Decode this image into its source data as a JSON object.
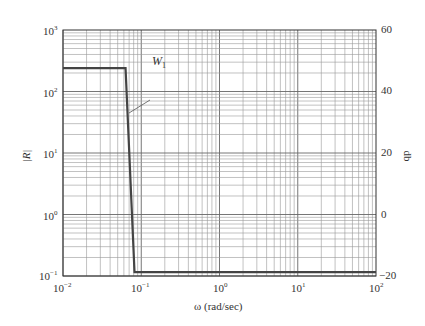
{
  "chart_data": {
    "type": "line",
    "title": "",
    "xlabel": "ω (rad/sec)",
    "ylabel": "|R|",
    "ylabel_right": "db",
    "xscale": "log",
    "yscale": "log",
    "xlim": [
      0.01,
      100
    ],
    "ylim": [
      0.1,
      1000
    ],
    "ylim_right_db": [
      -20,
      60
    ],
    "grid": true,
    "x_ticks": [
      {
        "base": "10",
        "exp": "−2"
      },
      {
        "base": "10",
        "exp": "−1"
      },
      {
        "base": "10",
        "exp": "0"
      },
      {
        "base": "10",
        "exp": "1"
      },
      {
        "base": "10",
        "exp": "2"
      }
    ],
    "y_ticks": [
      {
        "base": "10",
        "exp": "3"
      },
      {
        "base": "10",
        "exp": "2"
      },
      {
        "base": "10",
        "exp": "1"
      },
      {
        "base": "10",
        "exp": "0"
      },
      {
        "base": "10",
        "exp": "−1"
      }
    ],
    "y_right_ticks": [
      "60",
      "40",
      "20",
      "0",
      "−20"
    ],
    "series": [
      {
        "name": "W1",
        "label": "W",
        "label_sub": "1",
        "x": [
          0.01,
          0.063,
          0.082,
          100
        ],
        "y": [
          240,
          240,
          0.116,
          0.116
        ]
      }
    ]
  }
}
